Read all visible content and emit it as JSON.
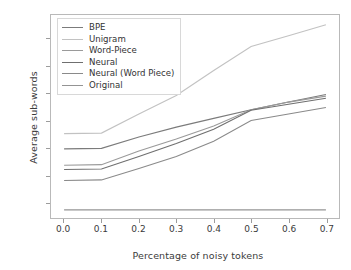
{
  "chart_data": {
    "type": "line",
    "title": "",
    "xlabel": "Percentage of noisy tokens",
    "ylabel": "Average sub-words",
    "x": [
      0.0,
      0.1,
      0.2,
      0.3,
      0.4,
      0.5,
      0.6,
      0.7
    ],
    "xlim": [
      -0.035,
      0.735
    ],
    "ylim": [
      8.55,
      27.2
    ],
    "xticks": [
      "0.0",
      "0.1",
      "0.2",
      "0.3",
      "0.4",
      "0.5",
      "0.6",
      "0.7"
    ],
    "xtick_values": [
      0.0,
      0.1,
      0.2,
      0.3,
      0.4,
      0.5,
      0.6,
      0.7
    ],
    "yticks": [
      "10.0",
      "12.5",
      "15.0",
      "17.5",
      "20.0",
      "22.5",
      "25.0"
    ],
    "ytick_values": [
      10.0,
      12.5,
      15.0,
      17.5,
      20.0,
      22.5,
      25.0
    ],
    "grid": false,
    "legend_position": "upper left",
    "series": [
      {
        "name": "BPE",
        "color": "#7b7b7b",
        "values": [
          14.9,
          14.95,
          16.0,
          16.9,
          17.7,
          18.5,
          19.2,
          19.9
        ]
      },
      {
        "name": "Unigram",
        "color": "#c2c2c2",
        "values": [
          16.3,
          16.35,
          18.1,
          19.8,
          22.1,
          24.3,
          25.3,
          26.3
        ]
      },
      {
        "name": "Word-Piece",
        "color": "#9a9a9a",
        "values": [
          13.4,
          13.45,
          14.7,
          15.8,
          17.0,
          18.5,
          19.2,
          19.75
        ]
      },
      {
        "name": "Neural",
        "color": "#6f6f6f",
        "values": [
          13.0,
          13.05,
          14.2,
          15.4,
          16.7,
          18.45,
          19.0,
          19.55
        ]
      },
      {
        "name": "Neural (Word Piece)",
        "color": "#8a8a8a",
        "values": [
          12.0,
          12.05,
          13.1,
          14.2,
          15.6,
          17.5,
          18.1,
          18.7
        ]
      },
      {
        "name": "Original",
        "color": "#949494",
        "values": [
          9.3,
          9.3,
          9.3,
          9.3,
          9.3,
          9.3,
          9.3,
          9.3
        ]
      }
    ]
  }
}
